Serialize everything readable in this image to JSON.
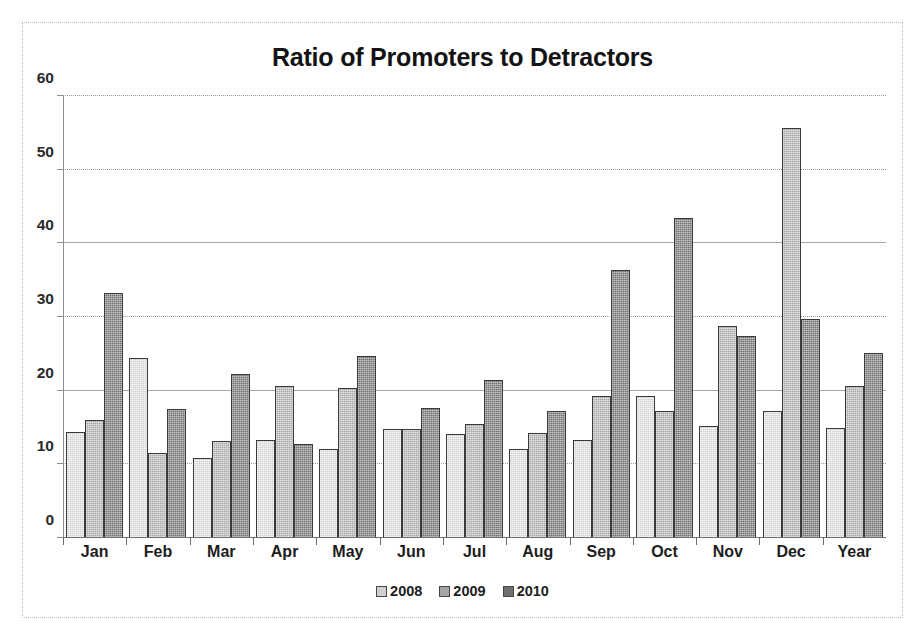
{
  "chart_data": {
    "type": "bar",
    "title": "Ratio of Promoters to Detractors",
    "xlabel": "",
    "ylabel": "",
    "ylim": [
      0,
      60
    ],
    "yticks": [
      0,
      10,
      20,
      30,
      40,
      50,
      60
    ],
    "grid": true,
    "legend_position": "bottom",
    "categories": [
      "Jan",
      "Feb",
      "Mar",
      "Apr",
      "May",
      "Jun",
      "Jul",
      "Aug",
      "Sep",
      "Oct",
      "Nov",
      "Dec",
      "Year"
    ],
    "series": [
      {
        "name": "2008",
        "color": "#d0d0d0",
        "values": [
          14.4,
          24.5,
          10.8,
          13.3,
          12.1,
          14.8,
          14.1,
          12.1,
          13.3,
          19.3,
          15.2,
          17.2,
          15.0
        ]
      },
      {
        "name": "2009",
        "color": "#a6a6a6",
        "values": [
          16.0,
          11.6,
          13.2,
          20.7,
          20.3,
          14.8,
          15.5,
          14.2,
          19.3,
          17.3,
          28.8,
          55.6,
          20.6
        ]
      },
      {
        "name": "2010",
        "color": "#6f6f6f",
        "values": [
          33.3,
          17.5,
          22.3,
          12.7,
          24.7,
          17.6,
          21.4,
          17.2,
          36.4,
          43.5,
          27.4,
          29.7,
          25.1
        ]
      }
    ]
  },
  "axis": {
    "y_tick_labels": [
      "0",
      "10",
      "20",
      "30",
      "40",
      "50",
      "60"
    ]
  },
  "legend": {
    "items": [
      {
        "label": "2008"
      },
      {
        "label": "2009"
      },
      {
        "label": "2010"
      }
    ]
  }
}
